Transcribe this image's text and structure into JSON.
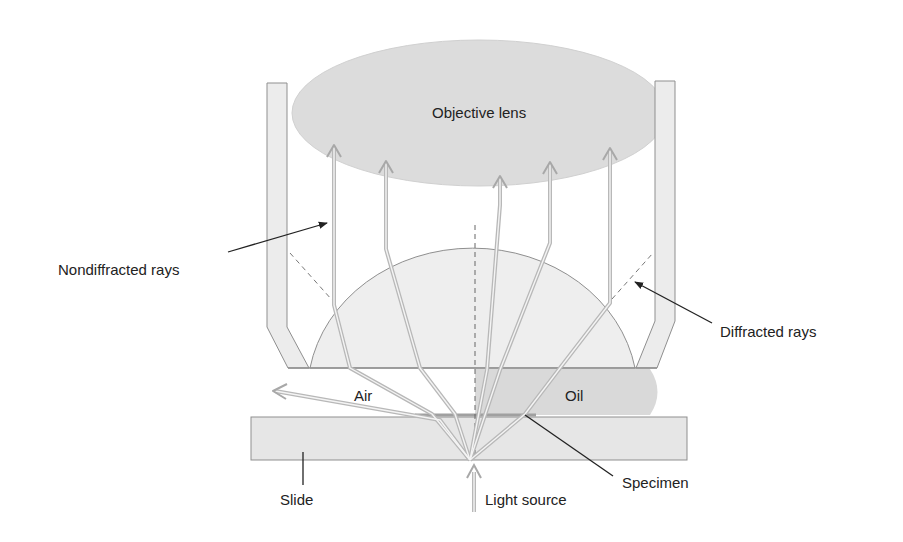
{
  "diagram": {
    "labels": {
      "objective_lens": "Objective lens",
      "nondiffracted_rays": "Nondiffracted rays",
      "diffracted_rays": "Diffracted rays",
      "air": "Air",
      "oil": "Oil",
      "slide": "Slide",
      "specimen": "Specimen",
      "light_source": "Light source"
    },
    "colors": {
      "lens_fill": "#dcdcdc",
      "housing_fill": "#ececec",
      "dome_fill": "#eeeeee",
      "oil_fill": "#d9d9d9",
      "slide_fill": "#e6e6e6",
      "ray": "#b8b8b8",
      "outline": "#8f8f8f",
      "leader": "#222222"
    }
  }
}
